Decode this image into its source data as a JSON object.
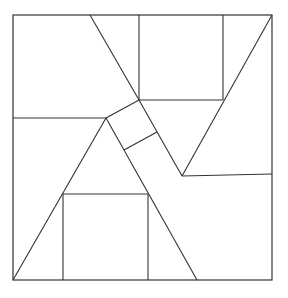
{
  "diagram": {
    "stroke": "#333333",
    "background": "#ffffff",
    "outer": {
      "x1": 13,
      "y1": 15,
      "x2": 272,
      "y2": 280
    },
    "lines": [
      {
        "id": "top-diag",
        "x1": 90,
        "y1": 15,
        "x2": 139,
        "y2": 100
      },
      {
        "id": "left-horiz",
        "x1": 13,
        "y1": 118,
        "x2": 106,
        "y2": 118
      },
      {
        "id": "top-square-left",
        "x1": 139,
        "y1": 15,
        "x2": 139,
        "y2": 100
      },
      {
        "id": "top-square-right",
        "x1": 223,
        "y1": 15,
        "x2": 223,
        "y2": 100
      },
      {
        "id": "top-square-bottom",
        "x1": 139,
        "y1": 100,
        "x2": 223,
        "y2": 100
      },
      {
        "id": "right-diag",
        "x1": 272,
        "y1": 15,
        "x2": 182,
        "y2": 176
      },
      {
        "id": "v-line",
        "x1": 139,
        "y1": 100,
        "x2": 182,
        "y2": 176
      },
      {
        "id": "right-horiz",
        "x1": 182,
        "y1": 176,
        "x2": 272,
        "y2": 174
      },
      {
        "id": "small-sq-top",
        "x1": 106,
        "y1": 118,
        "x2": 139,
        "y2": 100
      },
      {
        "id": "small-sq-mid",
        "x1": 124,
        "y1": 150,
        "x2": 157,
        "y2": 132
      },
      {
        "id": "left-slope",
        "x1": 106,
        "y1": 118,
        "x2": 13,
        "y2": 280
      },
      {
        "id": "right-slope",
        "x1": 106,
        "y1": 118,
        "x2": 197,
        "y2": 280
      },
      {
        "id": "bottom-square-top",
        "x1": 63,
        "y1": 194,
        "x2": 148,
        "y2": 194
      },
      {
        "id": "bottom-square-left",
        "x1": 63,
        "y1": 194,
        "x2": 63,
        "y2": 280
      },
      {
        "id": "bottom-square-right",
        "x1": 148,
        "y1": 194,
        "x2": 148,
        "y2": 280
      }
    ]
  }
}
